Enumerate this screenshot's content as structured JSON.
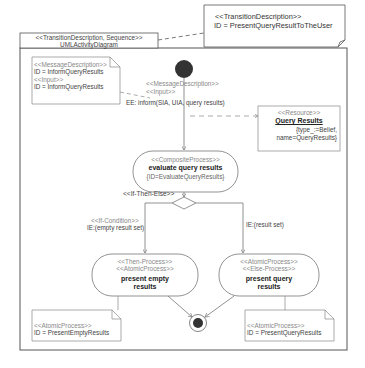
{
  "diagram": {
    "frame_label": {
      "stereotype": "<<TransitionDescription, Sequence>>",
      "name": "UMLActivityDiagram"
    },
    "top_note": {
      "stereotype": "<<TransitionDescription>>",
      "id_line": "ID = PresentQueryResultToTheUser"
    },
    "message_note": {
      "line1": "<<MessageDescription>>",
      "line2": "ID = InformQueryResults",
      "line3": "<<Input>>",
      "line4": "ID = InformQueryResults"
    },
    "initial_edge": {
      "stereotype1": "<<MessageDescription>>",
      "stereotype2": "<<Input>>",
      "label": "EE: inform(SIA, UIA, query results)"
    },
    "resource": {
      "stereotype": "<<Resource>>",
      "name": "Query Results",
      "prop1": "{type_:=Belief,",
      "prop2": "name=QueryResults}"
    },
    "composite_process": {
      "stereotype": "<<CompositeProcess>>",
      "name": "evaluate query results",
      "id": "{ID=EvaluateQueryResults}"
    },
    "decision": {
      "stereotype": "<<If-Then-Else>>"
    },
    "left_guard": {
      "stereotype": "<<If-Condition>>",
      "label": "IE:(empty result set)"
    },
    "right_guard": {
      "label": "IE:(result set)"
    },
    "then_process": {
      "stereotype1": "<<Then-Process>>",
      "stereotype2": "<<AtomicProcess>>",
      "name1": "present empty",
      "name2": "results"
    },
    "else_process": {
      "stereotype1": "<<AtomicProcess>>",
      "stereotype2": "<<Else-Process>>",
      "name1": "present query",
      "name2": "results"
    },
    "then_note": {
      "stereotype": "<<AtomicProcess>>",
      "id_line": "ID = PresentEmptyResults"
    },
    "else_note": {
      "stereotype": "<<AtomicProcess>>",
      "id_line": "ID = PresentQueryResults"
    }
  },
  "colors": {
    "line": "#777777",
    "frame": "#555555",
    "node_fill": "#333333"
  }
}
